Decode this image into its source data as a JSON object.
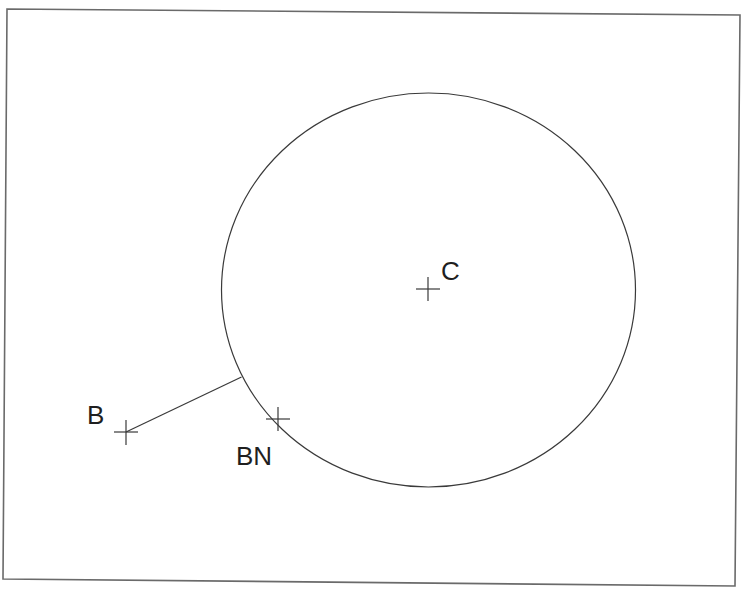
{
  "diagram": {
    "type": "geometry-construction",
    "frame": {
      "points": [
        [
          7,
          9
        ],
        [
          740,
          15
        ],
        [
          735,
          586
        ],
        [
          3,
          579
        ]
      ],
      "color": "#6a6a6a"
    },
    "circle": {
      "cx": 428.5,
      "cy": 290,
      "rx": 207,
      "ry": 197,
      "color": "#3a3a3a"
    },
    "points": [
      {
        "id": "C",
        "label": "C",
        "x": 428,
        "y": 289,
        "label_x": 441,
        "label_y": 280
      },
      {
        "id": "B",
        "label": "B",
        "x": 126,
        "y": 432,
        "label_x": 87,
        "label_y": 424
      },
      {
        "id": "BN",
        "label": "BN",
        "x": 278,
        "y": 419,
        "label_x": 236,
        "label_y": 465
      }
    ],
    "segments": [
      {
        "from": "B",
        "x1": 126,
        "y1": 432,
        "x2": 241.5,
        "y2": 377
      }
    ],
    "marker_size": 12
  },
  "labels": {
    "center": "C",
    "external_point": "B",
    "nearest_point": "BN"
  }
}
